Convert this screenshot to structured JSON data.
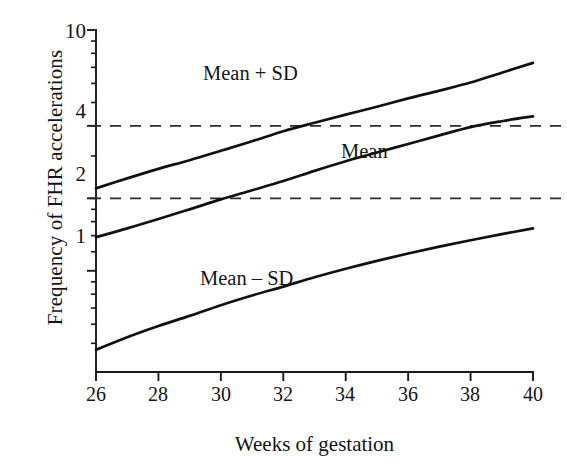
{
  "chart_data": {
    "type": "line",
    "title": "",
    "xlabel": "Weeks of gestation",
    "ylabel": "Frequency of FHR accelerations",
    "yscale": "log",
    "xlim": [
      26,
      40
    ],
    "ylim": [
      0.38,
      10
    ],
    "grid": false,
    "gridlines_dashed_y": [
      2,
      4
    ],
    "legend_position": "inline-annotations",
    "x": [
      26,
      27,
      28,
      29,
      30,
      31,
      32,
      33,
      34,
      35,
      36,
      37,
      38,
      39,
      40
    ],
    "xticks": [
      26,
      28,
      30,
      32,
      34,
      36,
      38,
      40
    ],
    "xtick_labels": [
      "26",
      "28",
      "30",
      "32",
      "34",
      "36",
      "38",
      "40"
    ],
    "yticks": [
      1,
      2,
      4,
      10
    ],
    "ytick_labels": [
      "1",
      "2",
      "4",
      "10"
    ],
    "yticks_minor": [
      0.5,
      0.6,
      0.7,
      0.8,
      0.9,
      1.2,
      1.4,
      1.6,
      1.8,
      3,
      5,
      6,
      7,
      8,
      9
    ],
    "series": [
      {
        "name": "Mean + SD",
        "label": "Mean + SD",
        "color": "#111111",
        "values": [
          2.2,
          2.42,
          2.65,
          2.88,
          3.15,
          3.45,
          3.8,
          4.12,
          4.45,
          4.8,
          5.2,
          5.6,
          6.05,
          6.65,
          7.3
        ]
      },
      {
        "name": "Mean",
        "label": "Mean",
        "color": "#111111",
        "values": [
          1.38,
          1.5,
          1.64,
          1.8,
          1.98,
          2.16,
          2.36,
          2.6,
          2.85,
          3.1,
          3.36,
          3.65,
          3.95,
          4.18,
          4.38
        ]
      },
      {
        "name": "Mean - SD",
        "label": "Mean – SD",
        "color": "#111111",
        "values": [
          0.47,
          0.53,
          0.59,
          0.65,
          0.72,
          0.79,
          0.86,
          0.94,
          1.02,
          1.1,
          1.18,
          1.26,
          1.34,
          1.42,
          1.5
        ]
      }
    ],
    "annotations": [
      {
        "text": "Mean + SD",
        "x_px": 203,
        "y_px": 62
      },
      {
        "text": "Mean",
        "x_px": 341,
        "y_px": 140
      },
      {
        "text": "Mean – SD",
        "x_px": 200,
        "y_px": 267
      }
    ]
  },
  "axes": {
    "axis_color": "#1a1a1a",
    "dash_color": "#2a2a2a",
    "plot_left_px": 96,
    "plot_right_px": 533,
    "plot_top_px": 30,
    "plot_bottom_px": 372
  }
}
